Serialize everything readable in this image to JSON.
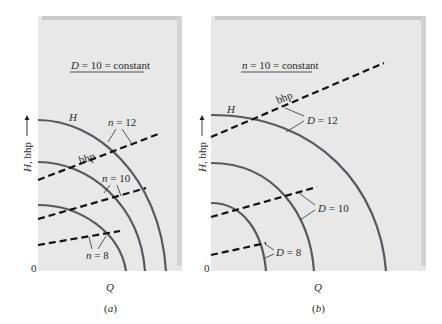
{
  "figure": {
    "panels": [
      {
        "id": "a",
        "caption": "(a)",
        "title": "D = 10 = constant",
        "title_parts": {
          "var": "D",
          "rest": " = 10 = constant"
        },
        "x_axis_label": "Q",
        "y_axis_label": "H, bhp",
        "origin_label": "0",
        "head_curve_label": "H",
        "bhp_label": "bhp",
        "parameter_name": "n",
        "curves": [
          {
            "label": "n = 12",
            "var": "n",
            "value": "12"
          },
          {
            "label": "n = 10",
            "var": "n",
            "value": "10"
          },
          {
            "label": "n = 8",
            "var": "n",
            "value": "8"
          }
        ]
      },
      {
        "id": "b",
        "caption": "(b)",
        "title": "n = 10 = constant",
        "title_parts": {
          "var": "n",
          "rest": " = 10 = constant"
        },
        "x_axis_label": "Q",
        "y_axis_label": "H, bhp",
        "origin_label": "0",
        "head_curve_label": "H",
        "bhp_label": "bhp",
        "parameter_name": "D",
        "curves": [
          {
            "label": "D = 12",
            "var": "D",
            "value": "12"
          },
          {
            "label": "D = 10",
            "var": "D",
            "value": "10"
          },
          {
            "label": "D = 8",
            "var": "D",
            "value": "8"
          }
        ]
      }
    ],
    "colors": {
      "panel_fill": "#e8e8e8",
      "panel_edge": "#c9c9c9",
      "head_curve": "#555a60",
      "bhp_dashed": "#111111"
    }
  }
}
